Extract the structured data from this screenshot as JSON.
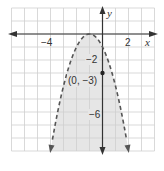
{
  "chart_data": {
    "type": "line",
    "title": "",
    "xlabel": "x",
    "ylabel": "y",
    "xlim": [
      -7,
      4
    ],
    "ylim": [
      -9,
      2
    ],
    "grid": true,
    "grid_step": 1,
    "x_tick_labels": [
      {
        "value": -4,
        "label": "−4"
      },
      {
        "value": 2,
        "label": "2"
      }
    ],
    "y_tick_labels": [
      {
        "value": -2,
        "label": "−2"
      },
      {
        "value": -6,
        "label": "−6"
      }
    ],
    "series": [
      {
        "name": "boundary",
        "equation": "y = -(x + 1)^2",
        "style": "dashed",
        "vertex": [
          -1,
          0
        ],
        "x": [
          -4,
          -3,
          -2,
          -1,
          0,
          1,
          2
        ],
        "values": [
          -9,
          -4,
          -1,
          0,
          -1,
          -4,
          -9
        ]
      }
    ],
    "shaded_region": "y < -(x + 1)^2",
    "annotations": [
      {
        "type": "point",
        "x": 0,
        "y": -3,
        "label": "(0, −3)"
      }
    ]
  },
  "labels": {
    "x_axis": "x",
    "y_axis": "y",
    "tick_neg4": "−4",
    "tick_2": "2",
    "tick_neg2": "−2",
    "tick_neg6": "−6",
    "point": "(0, −3)"
  },
  "colors": {
    "grid": "#cfcfcf",
    "axis": "#333333",
    "curve": "#555555",
    "shade": "#e6e6e6",
    "point": "#222222"
  }
}
